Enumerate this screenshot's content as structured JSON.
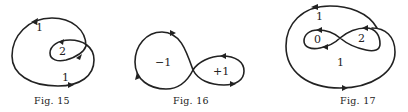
{
  "figures": [
    {
      "id": "fig15",
      "caption": "Fig. 15",
      "description": "Closed curve winding twice around an inner region",
      "region_labels": [
        "1",
        "2",
        "1"
      ]
    },
    {
      "id": "fig16",
      "caption": "Fig. 16",
      "description": "Figure-eight curve with opposite orientations in each lobe",
      "region_labels": [
        "−1",
        "+1"
      ]
    },
    {
      "id": "fig17",
      "caption": "Fig. 17",
      "description": "Figure-eight curve enclosed by an outer loop",
      "region_labels": [
        "1",
        "0",
        "2",
        "1"
      ]
    }
  ],
  "colors": {
    "ink": "#222222",
    "background": "#ffffff"
  }
}
